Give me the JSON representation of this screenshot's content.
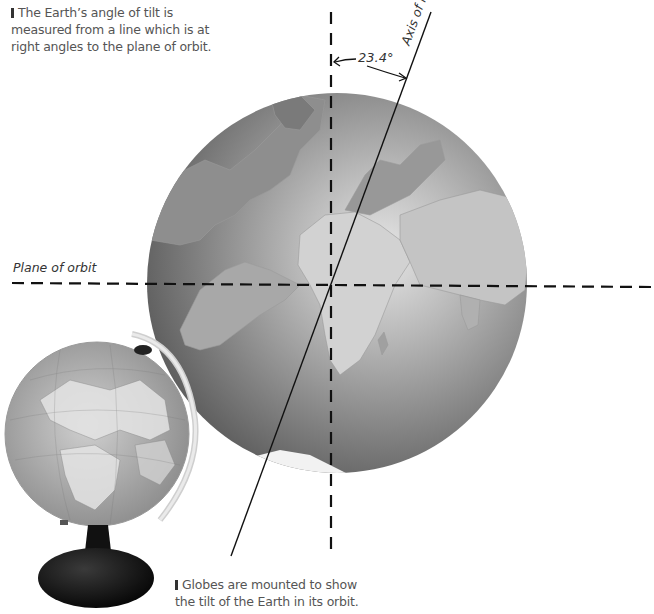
{
  "captions": {
    "top": {
      "line1": "The Earth’s angle of tilt is",
      "line2": "measured from a line which is at",
      "line3": "right angles to the plane of orbit."
    },
    "bottom": {
      "line1": "Globes are mounted to show",
      "line2": "the tilt of the Earth in its orbit."
    }
  },
  "labels": {
    "plane_of_orbit": "Plane of orbit",
    "axis_of_rotation": "Axis of rotation",
    "tilt_angle": "23.4°"
  },
  "colors": {
    "globe_dark": "#5a5a5a",
    "globe_mid": "#8a8a8a",
    "globe_light": "#d8d8d8",
    "land": "#b5b5b5",
    "line": "#111111",
    "caption_text": "#555555"
  }
}
